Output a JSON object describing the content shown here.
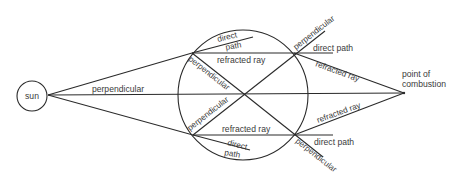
{
  "diagram": {
    "labels": {
      "sun": "sun",
      "central_ray": "perpendicular",
      "focal_point_line1": "point of",
      "focal_point_line2": "combustion",
      "upper": {
        "direct_path_inside_1": "direct",
        "direct_path_inside_2": "path",
        "refracted_inside": "refracted ray",
        "perpendicular_inside": "perpendicular",
        "perpendicular_outside": "perpendicular",
        "direct_path_outside": "direct path",
        "refracted_outside": "refracted ray"
      },
      "lower": {
        "direct_path_inside_1": "direct",
        "direct_path_inside_2": "path",
        "refracted_inside": "refracted ray",
        "perpendicular_inside": "perpendicular",
        "perpendicular_outside": "perpendicular",
        "direct_path_outside": "direct path",
        "refracted_outside": "refracted ray"
      }
    },
    "colors": {
      "line": "#2a2a2a",
      "text": "#3a3a3a",
      "background": "#ffffff"
    }
  }
}
